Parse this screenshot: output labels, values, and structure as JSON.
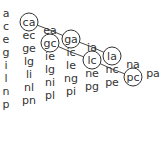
{
  "diagram": {
    "type": "pair-triangle",
    "columns": [
      {
        "x": 6,
        "start_y": 13,
        "items": [
          "a",
          "c",
          "e",
          "g",
          "i",
          "l",
          "n",
          "p"
        ]
      },
      {
        "x": 29,
        "start_y": 22,
        "items": [
          "ca",
          "ec",
          "ge",
          "lg",
          "li",
          "nl",
          "pn"
        ]
      },
      {
        "x": 50,
        "start_y": 30,
        "items": [
          "ea",
          "gc",
          "ie",
          "lg",
          "ni",
          "pl"
        ]
      },
      {
        "x": 71,
        "start_y": 39,
        "items": [
          "ga",
          "ic",
          "le",
          "ng",
          "pi"
        ]
      },
      {
        "x": 92,
        "start_y": 47,
        "items": [
          "ia",
          "lc",
          "ne",
          "pg"
        ]
      },
      {
        "x": 112,
        "start_y": 56,
        "items": [
          "la",
          "nc",
          "pe"
        ]
      },
      {
        "x": 133,
        "start_y": 64,
        "items": [
          "na",
          "pc"
        ]
      },
      {
        "x": 153,
        "start_y": 73,
        "items": [
          "pa"
        ]
      }
    ],
    "row_step": 13,
    "circled": [
      "1.0",
      "2.1",
      "3.0",
      "4.1",
      "5.0",
      "6.1"
    ],
    "chains": [
      [
        "1.0",
        "2.0",
        "3.0",
        "4.0",
        "5.0"
      ],
      [
        "2.1",
        "3.1",
        "4.1",
        "5.1",
        "6.1"
      ]
    ],
    "colors": {
      "text": "#333333",
      "line": "#333333",
      "circle": "#333333",
      "background": "#ffffff"
    }
  }
}
